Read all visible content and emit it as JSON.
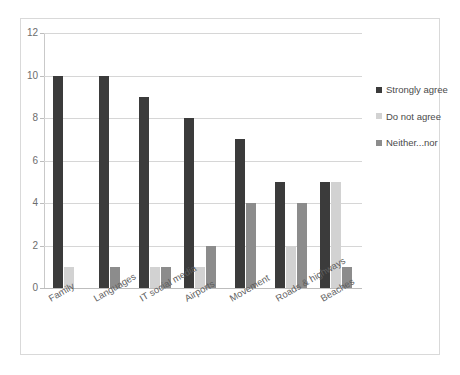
{
  "chart_data": {
    "type": "bar",
    "title": "",
    "subtitle": "",
    "xlabel": "",
    "ylabel": "",
    "ylim": [
      0,
      12
    ],
    "yticks": [
      0,
      2,
      4,
      6,
      8,
      10,
      12
    ],
    "ytick_labels": [
      "0",
      "2",
      "4",
      "6",
      "8",
      "10",
      "12"
    ],
    "grid": true,
    "grid_axis": "y",
    "legend_position": "right",
    "categories": [
      "Family",
      "Languages",
      "IT social media",
      "Airports",
      "Movement",
      "Roads & highways",
      "Beaches"
    ],
    "series": [
      {
        "name": "Strongly agree",
        "color": "#3b3b3b",
        "values": [
          10,
          10,
          9,
          8,
          7,
          5,
          5
        ]
      },
      {
        "name": "Do not agree",
        "color": "#d2d2d2",
        "values": [
          1,
          0,
          1,
          1,
          0,
          2,
          5
        ]
      },
      {
        "name": "Neither...nor",
        "color": "#8c8c8c",
        "values": [
          0,
          1,
          1,
          2,
          4,
          4,
          1
        ]
      }
    ]
  },
  "legend": {
    "items": [
      {
        "label": "Strongly agree",
        "swatch": "legend-swatch-strongly-agree"
      },
      {
        "label": "Do not agree",
        "swatch": "legend-swatch-do-not-agree"
      },
      {
        "label": "Neither...nor",
        "swatch": "legend-swatch-neither-nor"
      }
    ]
  }
}
